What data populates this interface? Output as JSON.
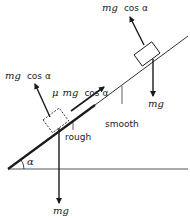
{
  "diagram": {
    "colors": {
      "ink": "#1a1a1a",
      "background": "#ffffff",
      "ground": "#555555"
    },
    "angle_label": "α",
    "surfaces": {
      "rough_label": "rough",
      "smooth_label": "smooth"
    },
    "lower_block": {
      "style": "dashed",
      "normal_label_mg": "mg",
      "normal_label_rest": "cos α",
      "friction_label_mu": "μ",
      "friction_label_mg": "mg",
      "friction_label_rest": "cos α",
      "weight_label": "mg"
    },
    "upper_block": {
      "style": "solid",
      "normal_label_mg": "mg",
      "normal_label_rest": "cos α",
      "weight_label": "mg"
    }
  }
}
